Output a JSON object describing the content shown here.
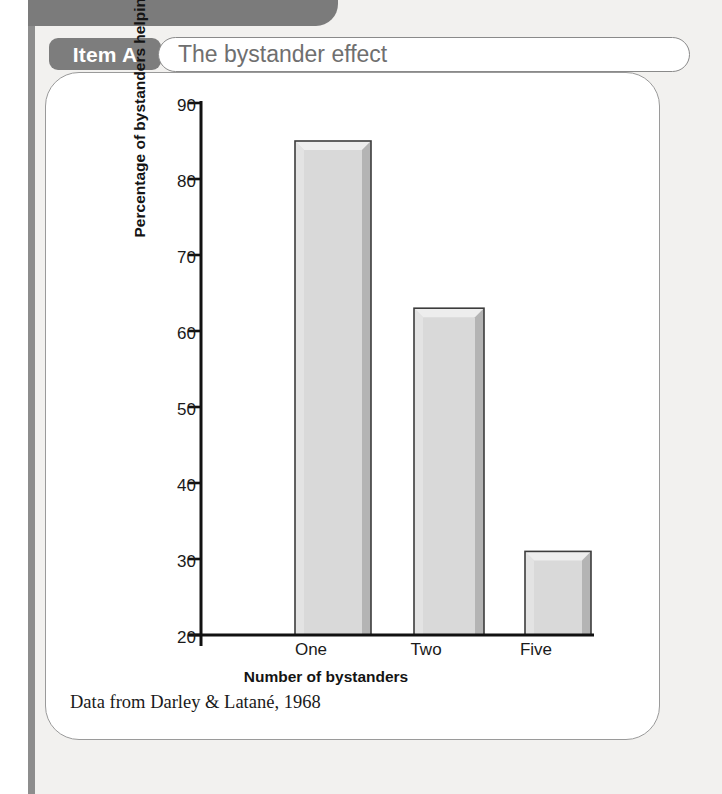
{
  "item": {
    "tag_label": "Item A",
    "title": "The bystander effect"
  },
  "caption": "Data from Darley & Latané, 1968",
  "colors": {
    "tag_background": "#7d7d7d",
    "tag_text": "#ffffff",
    "title_text": "#6f6f6f",
    "page_background": "#f2f1ef",
    "card_background": "#ffffff",
    "bar_fill": "#d8d8d8",
    "bar_edge": "#404040",
    "axis": "#101010"
  },
  "chart_data": {
    "type": "bar",
    "title": "The bystander effect",
    "categories": [
      "One",
      "Two",
      "Five"
    ],
    "values": [
      85,
      63,
      31
    ],
    "xlabel": "Number of bystanders",
    "ylabel": "Percentage of bystanders helping",
    "ylim": [
      20,
      90
    ],
    "yticks": [
      20,
      30,
      40,
      50,
      60,
      70,
      80,
      90
    ],
    "ytick_labels": [
      "20",
      "30",
      "40",
      "50",
      "60",
      "70",
      "80",
      "90"
    ],
    "grid": false,
    "legend": false,
    "source": "Data from Darley & Latané, 1968"
  }
}
